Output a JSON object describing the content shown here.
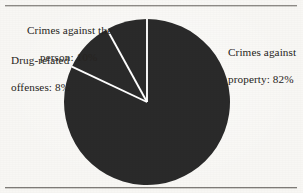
{
  "figure": {
    "background_color": "#f8f7f4",
    "rule_color": "#8d8a86",
    "has_top_rule": true,
    "has_bottom_rule": true
  },
  "labels": {
    "person": {
      "line1": "Crimes against the",
      "line2": "person: 10%"
    },
    "drug": {
      "line1": "Drug-related",
      "line2": "offenses: 8%"
    },
    "property": {
      "line1": "Crimes against",
      "line2": "property: 82%"
    }
  },
  "chart_data": {
    "type": "pie",
    "title": "",
    "categories": [
      "Crimes against property",
      "Crimes against the person",
      "Drug-related offenses"
    ],
    "values": [
      82,
      10,
      8
    ],
    "value_unit": "%",
    "labels": [
      "Crimes against property: 82%",
      "Crimes against the person: 10%",
      "Drug-related offenses: 8%"
    ],
    "slice_color": "#2a2a2a",
    "separator_color": "#ffffff",
    "start_angle_deg": 0,
    "direction": "clockwise",
    "center": {
      "x": 147,
      "y": 102
    },
    "radius": 83,
    "legend": "external-labels",
    "grid": false
  }
}
